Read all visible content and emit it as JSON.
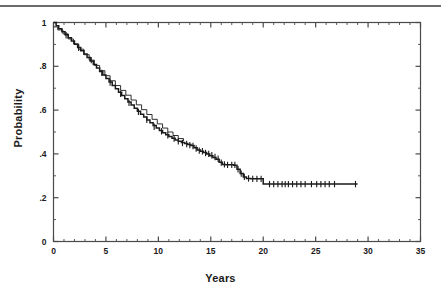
{
  "figure": {
    "top_rule_color": "#6b6b6b",
    "background": "#ffffff",
    "line_color": "#1a1a1a",
    "frame_color": "#4a4a4a"
  },
  "axes": {
    "xlabel": "Years",
    "ylabel": "Probability"
  },
  "chart_data": {
    "type": "line",
    "title": "",
    "subtitle": "",
    "xlabel": "Years",
    "ylabel": "Probability",
    "xlim": [
      0,
      35
    ],
    "ylim": [
      0,
      1
    ],
    "xticks": [
      0,
      5,
      10,
      15,
      20,
      25,
      30,
      35
    ],
    "xticklabels": [
      "0",
      "5",
      "10",
      "15",
      "20",
      "25",
      "30",
      "35"
    ],
    "yticks": [
      0,
      0.2,
      0.4,
      0.6,
      0.8,
      1
    ],
    "yticklabels": [
      "0",
      ".2",
      ".4",
      ".6",
      ".8",
      "1"
    ],
    "x_minor_step": 1,
    "y_minor_step": 0.1,
    "grid": false,
    "legend": null,
    "legend_position": "none",
    "annotations": [],
    "series": [
      {
        "name": "Kaplan-Meier survival estimate",
        "style": "step",
        "x": [
          0.0,
          0.25,
          0.5,
          0.8,
          1.1,
          1.4,
          1.7,
          2.0,
          2.3,
          2.6,
          2.9,
          3.2,
          3.5,
          3.8,
          4.1,
          4.4,
          4.7,
          5.0,
          5.3,
          5.6,
          5.9,
          6.2,
          6.5,
          6.8,
          7.1,
          7.4,
          7.7,
          8.0,
          8.3,
          8.6,
          8.9,
          9.2,
          9.5,
          9.8,
          10.1,
          10.4,
          10.7,
          11.0,
          11.3,
          11.6,
          11.9,
          12.2,
          12.5,
          12.8,
          13.1,
          13.4,
          13.7,
          14.0,
          14.3,
          14.6,
          14.9,
          15.2,
          15.5,
          15.8,
          16.1,
          16.4,
          16.8,
          17.2,
          17.5,
          17.8,
          18.1,
          18.4,
          18.8,
          19.2,
          19.6,
          20.0,
          20.4,
          29.0
        ],
        "y": [
          1.0,
          0.985,
          0.972,
          0.958,
          0.944,
          0.93,
          0.916,
          0.901,
          0.886,
          0.871,
          0.856,
          0.84,
          0.824,
          0.808,
          0.792,
          0.776,
          0.76,
          0.744,
          0.728,
          0.712,
          0.697,
          0.682,
          0.667,
          0.652,
          0.637,
          0.623,
          0.609,
          0.595,
          0.581,
          0.568,
          0.555,
          0.542,
          0.53,
          0.518,
          0.507,
          0.497,
          0.488,
          0.479,
          0.471,
          0.464,
          0.458,
          0.452,
          0.447,
          0.443,
          0.438,
          0.428,
          0.418,
          0.412,
          0.406,
          0.4,
          0.392,
          0.384,
          0.376,
          0.362,
          0.352,
          0.35,
          0.35,
          0.348,
          0.33,
          0.31,
          0.295,
          0.288,
          0.286,
          0.286,
          0.286,
          0.262,
          0.262,
          0.262
        ],
        "censor_x": [
          1.2,
          2.4,
          3.6,
          4.6,
          5.4,
          6.4,
          7.2,
          8.1,
          8.9,
          9.6,
          10.3,
          10.9,
          11.5,
          11.9,
          12.3,
          12.7,
          13.0,
          13.3,
          13.6,
          13.9,
          14.2,
          14.5,
          14.8,
          15.1,
          15.4,
          15.7,
          16.0,
          16.3,
          16.6,
          17.0,
          17.3,
          17.6,
          17.9,
          18.2,
          18.6,
          19.0,
          19.4,
          19.8,
          20.6,
          21.0,
          21.4,
          21.8,
          22.1,
          22.4,
          22.8,
          23.2,
          23.6,
          24.0,
          24.6,
          25.1,
          25.5,
          25.9,
          26.3,
          26.8,
          28.8
        ],
        "censor_y": [
          0.942,
          0.884,
          0.828,
          0.77,
          0.726,
          0.674,
          0.633,
          0.592,
          0.556,
          0.524,
          0.503,
          0.485,
          0.47,
          0.458,
          0.45,
          0.445,
          0.44,
          0.436,
          0.425,
          0.415,
          0.412,
          0.404,
          0.4,
          0.394,
          0.386,
          0.378,
          0.36,
          0.352,
          0.35,
          0.35,
          0.35,
          0.33,
          0.31,
          0.295,
          0.288,
          0.286,
          0.286,
          0.286,
          0.262,
          0.262,
          0.262,
          0.262,
          0.262,
          0.262,
          0.262,
          0.262,
          0.262,
          0.262,
          0.262,
          0.262,
          0.262,
          0.262,
          0.262,
          0.262,
          0.262
        ]
      },
      {
        "name": "Overlapping early curve",
        "style": "step",
        "x": [
          0.0,
          0.4,
          0.9,
          1.4,
          1.9,
          2.4,
          2.9,
          3.4,
          3.9,
          4.4,
          4.9,
          5.4,
          5.9,
          6.4,
          6.9,
          7.4,
          7.9,
          8.4,
          8.9,
          9.4,
          9.9,
          10.4,
          10.9,
          11.4,
          11.9,
          12.4
        ],
        "y": [
          0.98,
          0.966,
          0.948,
          0.925,
          0.902,
          0.878,
          0.853,
          0.828,
          0.804,
          0.78,
          0.757,
          0.734,
          0.712,
          0.69,
          0.668,
          0.646,
          0.624,
          0.602,
          0.58,
          0.558,
          0.537,
          0.518,
          0.5,
          0.484,
          0.47,
          0.458
        ],
        "censor_x": [],
        "censor_y": []
      }
    ]
  }
}
